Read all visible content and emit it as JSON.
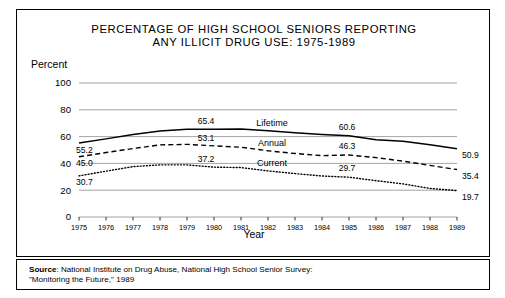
{
  "figure": {
    "title_line_1": "PERCENTAGE OF HIGH SCHOOL SENIORS REPORTING",
    "title_line_2": "ANY ILLICIT DRUG USE: 1975-1989",
    "y_axis_title": "Percent",
    "source_label": "Source",
    "source_line_1": ": National Institute on Drug Abuse, National High School Senior Survey:",
    "source_line_2": "\"Monitoring the Future,\" 1989"
  },
  "chart_data": {
    "type": "line",
    "title": "PERCENTAGE OF HIGH SCHOOL SENIORS REPORTING ANY ILLICIT DRUG USE: 1975-1989",
    "xlabel": "Year",
    "ylabel": "Percent",
    "ylim": [
      0,
      100
    ],
    "yticks": [
      0,
      20,
      40,
      60,
      80,
      100
    ],
    "grid": true,
    "legend": "inline-labels",
    "x": [
      1975,
      1976,
      1977,
      1978,
      1979,
      1980,
      1981,
      1982,
      1983,
      1984,
      1985,
      1986,
      1987,
      1988,
      1989
    ],
    "xticklabels": [
      "1975",
      "1976",
      "1977",
      "1978",
      "1979",
      "1980",
      "1981",
      "1982",
      "1983",
      "1984",
      "1985",
      "1986",
      "1987",
      "1988",
      "1989"
    ],
    "series": [
      {
        "name": "Lifetime",
        "style": "solid",
        "values": [
          55.2,
          58.3,
          61.6,
          64.1,
          65.4,
          65.4,
          65.6,
          64.4,
          62.9,
          61.6,
          60.6,
          57.6,
          56.6,
          53.9,
          50.9
        ],
        "start_label": "55.2",
        "mid_label": "65.4",
        "late_label": "60.6",
        "end_label": "50.9"
      },
      {
        "name": "Annual",
        "style": "dashed",
        "values": [
          45.0,
          48.1,
          51.1,
          53.8,
          54.2,
          53.1,
          52.1,
          49.4,
          47.4,
          45.8,
          46.3,
          44.3,
          41.7,
          38.5,
          35.4
        ],
        "start_label": "45.0",
        "mid_label": "53.1",
        "late_label": "46.3",
        "end_label": "35.4"
      },
      {
        "name": "Current",
        "style": "dotted",
        "values": [
          30.7,
          34.2,
          37.6,
          38.9,
          38.9,
          37.2,
          36.9,
          34.4,
          32.4,
          30.6,
          29.7,
          27.1,
          24.7,
          21.3,
          19.7
        ],
        "start_label": "30.7",
        "mid_label": "37.2",
        "late_label": "29.7",
        "end_label": "19.7"
      }
    ]
  }
}
